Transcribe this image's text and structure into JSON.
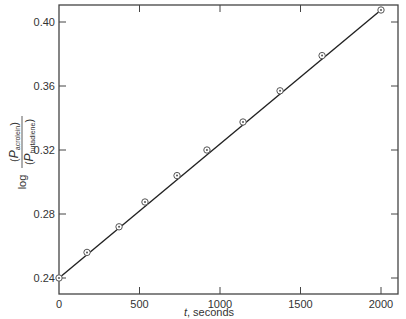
{
  "chart_data": {
    "type": "line",
    "title": "",
    "xlabel": "t, seconds",
    "xlabel_italic_part": "t",
    "xlabel_rest": ", seconds",
    "ylabel": "log (P_acrolein / P_butadiene)",
    "ylabel_parts": {
      "log": "log",
      "numerator_symbol": "P",
      "numerator_sub": "acrolein",
      "denominator_symbol": "P",
      "denominator_sub": "butadiene"
    },
    "xlim": [
      0,
      2100
    ],
    "ylim": [
      0.229,
      0.411
    ],
    "x_ticks": [
      0,
      500,
      1000,
      1500,
      2000
    ],
    "x_tick_labels": [
      "0",
      "500",
      "1000",
      "1500",
      "2000"
    ],
    "y_ticks": [
      0.24,
      0.28,
      0.32,
      0.36,
      0.4
    ],
    "y_tick_labels": [
      "0.24",
      "0.28",
      "0.32",
      "0.36",
      "0.40"
    ],
    "grid": false,
    "legend": null,
    "series": [
      {
        "name": "measured",
        "marker": "circled-dot",
        "x": [
          0,
          174,
          373,
          534,
          733,
          919,
          1143,
          1373,
          1634,
          2000
        ],
        "y": [
          0.24,
          0.256,
          0.272,
          0.2875,
          0.304,
          0.32,
          0.3375,
          0.357,
          0.379,
          0.4075
        ]
      },
      {
        "name": "fit line",
        "style": "solid",
        "x": [
          0,
          2000
        ],
        "y": [
          0.24,
          0.4075
        ]
      }
    ]
  },
  "colors": {
    "axis": "#444444",
    "line": "#222222",
    "marker": "#555555",
    "text": "#333333"
  }
}
